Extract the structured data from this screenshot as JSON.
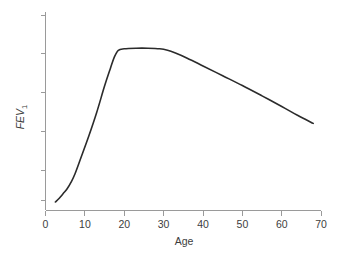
{
  "chart_data": {
    "type": "line",
    "title": "",
    "xlabel": "Age",
    "ylabel": "FEV",
    "ylabel_subscript": "1",
    "xlim": [
      0,
      70
    ],
    "ylim": [
      0,
      1
    ],
    "grid": false,
    "legend": null,
    "xticks": [
      0,
      10,
      20,
      30,
      40,
      50,
      60,
      70
    ],
    "xtick_labels": [
      "0",
      "10",
      "20",
      "30",
      "40",
      "50",
      "60",
      "70"
    ],
    "ytick_labels": [
      "",
      "",
      "",
      "",
      "",
      ""
    ],
    "ytick_count": 6,
    "series": [
      {
        "name": "FEV1 by age",
        "x": [
          2.5,
          3.5,
          4.5,
          5.5,
          6.5,
          7.5,
          9,
          11,
          13,
          15,
          16.5,
          17.5,
          18.5,
          20,
          23,
          26,
          29,
          31,
          33,
          36,
          40,
          45,
          50,
          55,
          60,
          64,
          68
        ],
        "y": [
          0.045,
          0.065,
          0.09,
          0.115,
          0.15,
          0.195,
          0.28,
          0.395,
          0.52,
          0.66,
          0.755,
          0.815,
          0.85,
          0.858,
          0.861,
          0.861,
          0.858,
          0.85,
          0.835,
          0.808,
          0.767,
          0.715,
          0.663,
          0.608,
          0.552,
          0.505,
          0.462
        ]
      }
    ]
  },
  "colors": {
    "background": "#ffffff",
    "curve": "#2b2b2b",
    "axis": "#9a9a9a",
    "text": "#3d3d3d"
  }
}
